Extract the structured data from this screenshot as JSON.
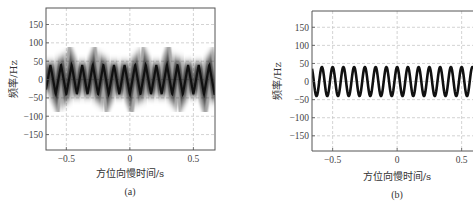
{
  "figure": {
    "panels": [
      {
        "caption": "(a)"
      },
      {
        "caption": "(b)"
      }
    ]
  },
  "chart_data": [
    {
      "type": "line",
      "subtype": "time-frequency spectrogram (blurred triangular micro-Doppler curve)",
      "caption": "(a)",
      "title": "",
      "xlabel": "方位向慢时间/s",
      "ylabel": "频率/Hz",
      "xlim": [
        -0.66,
        0.67
      ],
      "ylim": [
        -192,
        195
      ],
      "xticks": [
        -0.5,
        0,
        0.5
      ],
      "xtick_labels": [
        "-0.5",
        "0",
        "0.5"
      ],
      "yticks": [
        150,
        100,
        50,
        0,
        -50,
        -100,
        -150
      ],
      "ytick_labels": [
        "150",
        "100",
        "50",
        "0",
        "-50",
        "-100",
        "-150"
      ],
      "grid": true,
      "grid_style": "dashed",
      "legend": null,
      "series": [
        {
          "name": "micro-Doppler frequency",
          "waveform": "triangular",
          "amplitude_hz": 40,
          "offset_hz": 0,
          "frequency_hz": 12,
          "phase": 0.0,
          "color": "#111111",
          "spread_hz": 25,
          "note": "energy smeared vertically (grayscale blur), sharp peaks"
        }
      ]
    },
    {
      "type": "line",
      "subtype": "time-frequency curve (clean sinusoidal micro-Doppler)",
      "caption": "(b)",
      "title": "",
      "xlabel": "方位向慢时间/s",
      "ylabel": "频率/Hz",
      "xlim": [
        -0.66,
        0.67
      ],
      "ylim": [
        -192,
        195
      ],
      "xticks": [
        -0.5,
        0,
        0.5
      ],
      "xtick_labels": [
        "-0.5",
        "0",
        "0.5"
      ],
      "yticks": [
        150,
        100,
        50,
        0,
        -50,
        -100,
        -150
      ],
      "ytick_labels": [
        "150",
        "100",
        "50",
        "0",
        "-50",
        "-100",
        "-150"
      ],
      "grid": true,
      "grid_style": "dashed",
      "legend": null,
      "series": [
        {
          "name": "micro-Doppler frequency",
          "waveform": "sinusoidal",
          "amplitude_hz": 40,
          "offset_hz": 0,
          "frequency_hz": 12,
          "phase": 1.57,
          "color": "#111111",
          "line_width": 2.6
        }
      ]
    }
  ]
}
